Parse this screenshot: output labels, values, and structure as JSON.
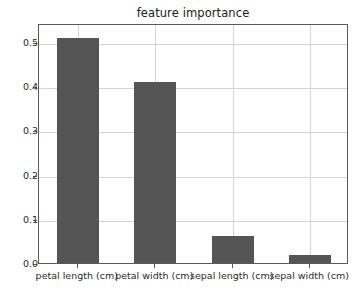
{
  "chart_data": {
    "type": "bar",
    "title": "feature importance",
    "xlabel": "",
    "ylabel": "",
    "categories": [
      "petal length (cm)",
      "petal width (cm)",
      "sepal length (cm)",
      "sepal width (cm)"
    ],
    "values": [
      0.508,
      0.41,
      0.061,
      0.018
    ],
    "ylim": [
      0.0,
      0.543
    ],
    "yticks": [
      0.0,
      0.1,
      0.2,
      0.3,
      0.4,
      0.5
    ],
    "ytick_labels": [
      "0.0",
      "0.1",
      "0.2",
      "0.3",
      "0.4",
      "0.5"
    ],
    "grid": true,
    "legend": false,
    "legend_position": "none",
    "bar_color": "#555555",
    "grid_color": "#d4d4d4",
    "axes_color": "#5a5a5a",
    "background_color": "#ffffff",
    "bar_width_ratio": 0.54
  }
}
